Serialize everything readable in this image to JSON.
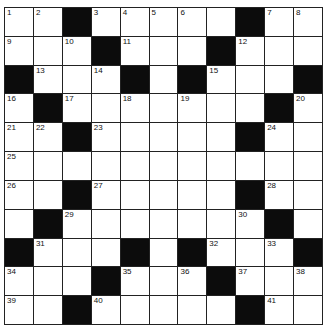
{
  "puzzle": {
    "type": "crossword",
    "rows": 11,
    "cols": 11,
    "colors": {
      "block": "#0c0c0c",
      "cell": "#ffffff",
      "line": "#222222"
    },
    "grid": [
      [
        "1",
        "2",
        "#",
        "3",
        "4",
        "5",
        "6",
        "",
        "#",
        "7",
        "8"
      ],
      [
        "9",
        "",
        "10",
        "#",
        "11",
        "",
        "",
        "#",
        "12",
        "",
        ""
      ],
      [
        "#",
        "13",
        "",
        "14",
        "#",
        "",
        "#",
        "15",
        "",
        "",
        "#"
      ],
      [
        "16",
        "#",
        "17",
        "",
        "18",
        "",
        "19",
        "",
        "",
        "#",
        "20"
      ],
      [
        "21",
        "22",
        "#",
        "23",
        "",
        "",
        "",
        "",
        "#",
        "24",
        ""
      ],
      [
        "25",
        "",
        "",
        "",
        "",
        "",
        "",
        "",
        "",
        "",
        ""
      ],
      [
        "26",
        "",
        "#",
        "27",
        "",
        "",
        "",
        "",
        "#",
        "28",
        ""
      ],
      [
        "",
        "#",
        "29",
        "",
        "",
        "",
        "",
        "",
        "30",
        "#",
        ""
      ],
      [
        "#",
        "31",
        "",
        "",
        "#",
        "",
        "#",
        "32",
        "",
        "33",
        "#"
      ],
      [
        "34",
        "",
        "",
        "#",
        "35",
        "",
        "36",
        "#",
        "37",
        "",
        "38"
      ],
      [
        "39",
        "",
        "#",
        "40",
        "",
        "",
        "",
        "",
        "#",
        "41",
        ""
      ]
    ]
  }
}
